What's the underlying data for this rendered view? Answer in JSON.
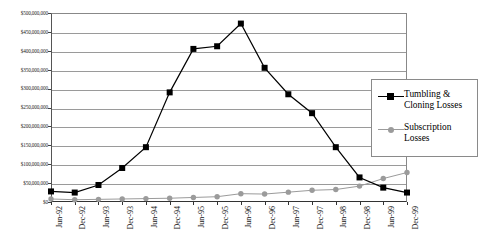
{
  "chart_data": {
    "type": "line",
    "title": "",
    "xlabel": "",
    "ylabel": "",
    "grid": true,
    "legend_position": "right-inside",
    "ylim": [
      0,
      500000000
    ],
    "ytick_step": 50000000,
    "ytick_labels": [
      "$500,000,000",
      "$450,000,000",
      "$400,000,000",
      "$350,000,000",
      "$300,000,000",
      "$250,000,000",
      "$200,000,000",
      "$150,000,000",
      "$100,000,000",
      "$50,000,000",
      "$0"
    ],
    "ytick_values": [
      500000000,
      450000000,
      400000000,
      350000000,
      300000000,
      250000000,
      200000000,
      150000000,
      100000000,
      50000000,
      0
    ],
    "categories": [
      "Jun-92",
      "Dec-92",
      "Jun-93",
      "Dec-93",
      "Jun-94",
      "Dec-94",
      "Jun-95",
      "Dec-95",
      "Jun-96",
      "Dec-96",
      "Jun-97",
      "Dec-97",
      "Jun-98",
      "Dec-98",
      "Jun-99",
      "Dec-99"
    ],
    "series": [
      {
        "name": "Tumbling & Cloning Losses",
        "color": "#000000",
        "marker": "square",
        "values": [
          28000000,
          25000000,
          45000000,
          90000000,
          145000000,
          290000000,
          405000000,
          412000000,
          472000000,
          355000000,
          285000000,
          235000000,
          145000000,
          65000000,
          38000000,
          25000000
        ]
      },
      {
        "name": "Subscription Losses",
        "color": "#9b9b9b",
        "marker": "circle",
        "values": [
          8000000,
          6000000,
          7000000,
          8000000,
          9000000,
          10000000,
          12000000,
          14000000,
          22000000,
          21000000,
          26000000,
          31000000,
          33000000,
          42000000,
          62000000,
          78000000
        ]
      }
    ]
  },
  "legend": {
    "items": [
      {
        "label_line1": "Tumbling &",
        "label_line2": "Cloning Losses"
      },
      {
        "label_line1": "Subscription",
        "label_line2": "Losses"
      }
    ]
  }
}
